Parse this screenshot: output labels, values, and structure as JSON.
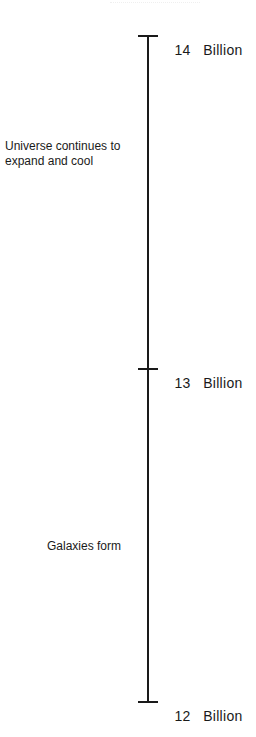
{
  "timeline": {
    "ticks": [
      {
        "value": "14",
        "unit": "Billion",
        "y": 35
      },
      {
        "value": "13",
        "unit": "Billion",
        "y": 368
      },
      {
        "value": "12",
        "unit": "Billion",
        "y": 701
      }
    ],
    "events": [
      {
        "label": "Universe continues to\nexpand and cool",
        "y": 139,
        "x": 5
      },
      {
        "label": "Galaxies form",
        "y": 539,
        "x": 47
      }
    ],
    "line_color": "#1a1a1a"
  }
}
